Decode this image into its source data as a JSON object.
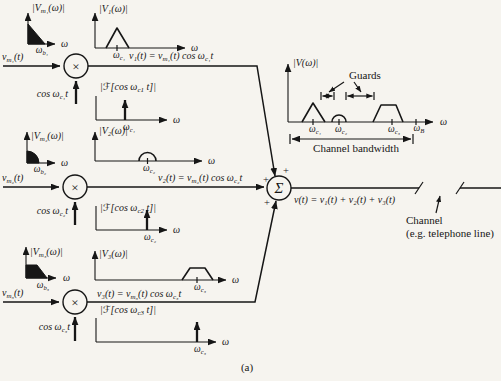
{
  "figure": {
    "caption": "(a)",
    "channels": [
      {
        "input": "v_{m₁}(t)",
        "multiplier": "×",
        "carrier": "cos ω_{c₁}t",
        "equation": "v₁(t) = v_{m₁}(t) cos ω_{c₁}t",
        "message_spectrum": {
          "ylabel": "|V_{m₁}(ω)|",
          "tick": "ω_{b₁}",
          "xlabel": "ω",
          "shape": "filled lowpass triangle at origin"
        },
        "modulated_spectrum": {
          "ylabel": "|V₁(ω)|",
          "tick": "ω_{c₁}",
          "xlabel": "ω",
          "shape": "triangle centered at carrier"
        },
        "carrier_spectrum": {
          "ylabel": "|ℱ[cos ω_{c1} t]|",
          "tick": "ω_{c₁}",
          "xlabel": "ω",
          "shape": "impulse at carrier"
        }
      },
      {
        "input": "v_{m₂}(t)",
        "multiplier": "×",
        "carrier": "cos ω_{c₂}t",
        "equation": "v₂(t) = v_{m₂}(t) cos ω_{c₂}t",
        "message_spectrum": {
          "ylabel": "|V_{m₂}(ω)|",
          "tick": "ω_{b₂}",
          "xlabel": "ω",
          "shape": "filled lowpass quarter-dome at origin"
        },
        "modulated_spectrum": {
          "ylabel": "|V₂(ω)|",
          "tick": "ω_{c₂}",
          "xlabel": "ω",
          "shape": "dome centered at carrier"
        },
        "carrier_spectrum": {
          "ylabel": "|ℱ[cos ω_{c2} t]|",
          "tick": "ω_{c₂}",
          "xlabel": "ω",
          "shape": "impulse at carrier"
        }
      },
      {
        "input": "v_{m₃}(t)",
        "multiplier": "×",
        "carrier": "cos ω_{c₃}t",
        "equation": "v₃(t) = v_{m₃}(t) cos ω_{c₃}t",
        "message_spectrum": {
          "ylabel": "|V_{m₃}(ω)|",
          "tick": "ω_{b₃}",
          "xlabel": "ω",
          "shape": "filled lowpass trapezoid at origin"
        },
        "modulated_spectrum": {
          "ylabel": "|V₃(ω)|",
          "tick": "ω_{c₃}",
          "xlabel": "ω",
          "shape": "trapezoid centered at carrier"
        },
        "carrier_spectrum": {
          "ylabel": "|ℱ[cos ω_{c3} t]|",
          "tick": "ω_{c₃}",
          "xlabel": "ω",
          "shape": "impulse at carrier"
        }
      }
    ],
    "summer": {
      "symbol": "Σ",
      "plus_top": "+",
      "plus_left": "+",
      "plus_bottom": "+"
    },
    "output": {
      "equation": "v(t) = v₁(t) + v₂(t) + v₃(t)",
      "channel_label": "Channel",
      "channel_sublabel": "(e.g. telephone line)"
    },
    "composite_spectrum": {
      "ylabel": "|V(ω)|",
      "xlabel": "ω",
      "guards": "Guards",
      "bandwidth": "Channel bandwidth",
      "ticks": [
        "ω_{c₁}",
        "ω_{c₂}",
        "ω_{c₃}",
        "ω_{B}"
      ],
      "shapes": "triangle, dome, trapezoid with guard bands"
    }
  }
}
